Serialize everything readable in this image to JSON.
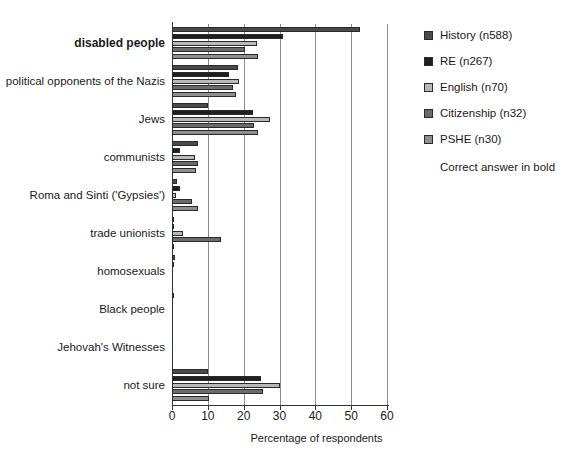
{
  "chart_data": {
    "type": "bar",
    "orientation": "horizontal",
    "title": "",
    "xlabel": "Percentage of respondents",
    "ylabel": "",
    "xlim": [
      0,
      60
    ],
    "xticks": [
      0,
      10,
      20,
      30,
      40,
      50,
      60
    ],
    "grid": true,
    "legend_position": "right",
    "note": "Correct answer in bold",
    "bold_category": "disabled people",
    "categories": [
      "disabled people",
      "political opponents of the Nazis",
      "Jews",
      "communists",
      "Roma and Sinti ('Gypsies')",
      "trade unionists",
      "homosexuals",
      "Black people",
      "Jehovah's Witnesses",
      "not sure"
    ],
    "series": [
      {
        "name": "History (n588)",
        "color": "#4a4a4a",
        "values": [
          52.5,
          18.5,
          10.0,
          7.2,
          1.4,
          0.2,
          0.8,
          0.2,
          0.0,
          10.0
        ]
      },
      {
        "name": "RE (n267)",
        "color": "#1f1f1f",
        "values": [
          31.0,
          16.0,
          22.5,
          2.3,
          2.3,
          0.2,
          0.3,
          0.0,
          0.0,
          24.8
        ]
      },
      {
        "name": "English (n70)",
        "color": "#b9b9b9",
        "values": [
          23.6,
          18.7,
          27.3,
          6.3,
          1.2,
          3.2,
          0.0,
          0.0,
          0.0,
          30.0
        ]
      },
      {
        "name": "Citizenship (n32)",
        "color": "#6b6b6b",
        "values": [
          20.5,
          17.0,
          23.0,
          7.2,
          5.6,
          13.8,
          0.0,
          0.0,
          0.0,
          25.5
        ]
      },
      {
        "name": "PSHE (n30)",
        "color": "#8f8f8f",
        "values": [
          24.0,
          17.8,
          24.0,
          6.8,
          7.2,
          0.3,
          0.0,
          0.0,
          0.0,
          10.3
        ]
      }
    ]
  },
  "legend": {
    "items": [
      {
        "label": "History (n588)"
      },
      {
        "label": "RE (n267)"
      },
      {
        "label": "English (n70)"
      },
      {
        "label": "Citizenship (n32)"
      },
      {
        "label": "PSHE (n30)"
      }
    ],
    "note": "Correct answer in bold"
  },
  "axis": {
    "x_title": "Percentage of respondents",
    "x_tick_labels": [
      "0",
      "10",
      "20",
      "30",
      "40",
      "50",
      "60"
    ]
  }
}
